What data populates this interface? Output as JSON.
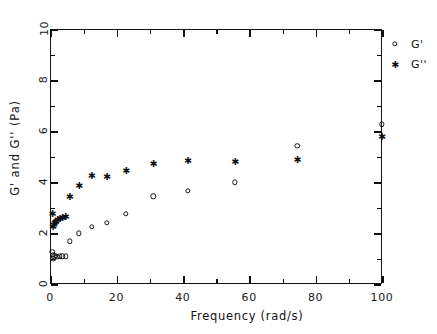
{
  "chart_data": {
    "type": "scatter",
    "title": "",
    "xlabel": "Frequency (rad/s)",
    "ylabel": "G' and G'' (Pa)",
    "xlim": [
      0,
      100
    ],
    "ylim": [
      0,
      10
    ],
    "xticks": [
      0,
      20,
      40,
      60,
      80,
      100
    ],
    "yticks": [
      0,
      2,
      4,
      6,
      8,
      10
    ],
    "xtick_labels": [
      "0",
      "20",
      "40",
      "60",
      "80",
      "100"
    ],
    "ytick_labels": [
      "0",
      "2",
      "4",
      "6",
      "8",
      "10"
    ],
    "x_minor_ticks": [
      10,
      30,
      50,
      70,
      90
    ],
    "y_minor_ticks": [
      1,
      3,
      5,
      7,
      9
    ],
    "grid": false,
    "legend_position": "outside-right-top",
    "series": [
      {
        "name": "G'",
        "marker": "open-circle",
        "color": "#141414",
        "points": [
          [
            0.35,
            1.3
          ],
          [
            0.55,
            1.18
          ],
          [
            0.75,
            1.02
          ],
          [
            1.05,
            1.12
          ],
          [
            1.45,
            1.15
          ],
          [
            1.95,
            1.1
          ],
          [
            2.6,
            1.13
          ],
          [
            3.4,
            1.12
          ],
          [
            4.4,
            1.13
          ],
          [
            5.6,
            1.72
          ],
          [
            8.4,
            2.02
          ],
          [
            12.2,
            2.28
          ],
          [
            16.8,
            2.44
          ],
          [
            22.6,
            2.8
          ],
          [
            30.8,
            3.48
          ],
          [
            41.2,
            3.7
          ],
          [
            55.4,
            4.02
          ],
          [
            74.2,
            5.46
          ],
          [
            99.6,
            6.3
          ]
        ]
      },
      {
        "name": "G''",
        "marker": "asterisk",
        "color": "#111111",
        "points": [
          [
            0.35,
            2.82
          ],
          [
            0.55,
            2.3
          ],
          [
            0.78,
            2.36
          ],
          [
            1.05,
            2.44
          ],
          [
            1.45,
            2.5
          ],
          [
            1.95,
            2.56
          ],
          [
            2.6,
            2.6
          ],
          [
            3.4,
            2.65
          ],
          [
            4.4,
            2.68
          ],
          [
            5.6,
            3.48
          ],
          [
            8.4,
            3.92
          ],
          [
            12.2,
            4.3
          ],
          [
            16.8,
            4.26
          ],
          [
            22.6,
            4.48
          ],
          [
            30.8,
            4.76
          ],
          [
            41.2,
            4.88
          ],
          [
            55.4,
            4.86
          ],
          [
            74.2,
            4.94
          ],
          [
            99.6,
            5.84
          ]
        ]
      }
    ]
  },
  "legend": {
    "entries": [
      {
        "label": "G'",
        "marker": "open-circle"
      },
      {
        "label": "G''",
        "marker": "asterisk"
      }
    ]
  }
}
